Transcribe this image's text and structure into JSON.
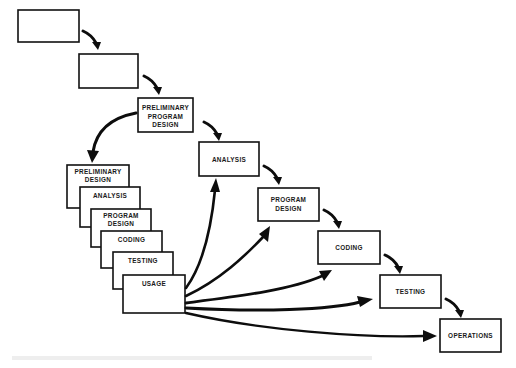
{
  "diagram": {
    "type": "waterfall-with-prototype-iteration",
    "main_flow": [
      {
        "id": "step-1",
        "label": ""
      },
      {
        "id": "step-2",
        "label": ""
      },
      {
        "id": "preliminary-program-design",
        "label_lines": [
          "PRELIMINARY",
          "PROGRAM",
          "DESIGN"
        ]
      },
      {
        "id": "analysis",
        "label_lines": [
          "ANALYSIS"
        ]
      },
      {
        "id": "program-design",
        "label_lines": [
          "PROGRAM",
          "DESIGN"
        ]
      },
      {
        "id": "coding",
        "label_lines": [
          "CODING"
        ]
      },
      {
        "id": "testing",
        "label_lines": [
          "TESTING"
        ]
      },
      {
        "id": "operations",
        "label_lines": [
          "OPERATIONS"
        ]
      }
    ],
    "prototype_stack": [
      {
        "id": "proto-preliminary-design",
        "label_lines": [
          "PRELIMINARY",
          "DESIGN"
        ]
      },
      {
        "id": "proto-analysis",
        "label_lines": [
          "ANALYSIS"
        ]
      },
      {
        "id": "proto-program-design",
        "label_lines": [
          "PROGRAM",
          "DESIGN"
        ]
      },
      {
        "id": "proto-coding",
        "label_lines": [
          "CODING"
        ]
      },
      {
        "id": "proto-testing",
        "label_lines": [
          "TESTING"
        ]
      },
      {
        "id": "proto-usage",
        "label_lines": [
          "USAGE"
        ]
      }
    ],
    "edges": [
      {
        "from": "step-1",
        "to": "step-2"
      },
      {
        "from": "step-2",
        "to": "preliminary-program-design"
      },
      {
        "from": "preliminary-program-design",
        "to": "analysis"
      },
      {
        "from": "analysis",
        "to": "program-design"
      },
      {
        "from": "program-design",
        "to": "coding"
      },
      {
        "from": "coding",
        "to": "testing"
      },
      {
        "from": "testing",
        "to": "operations"
      },
      {
        "from": "preliminary-program-design",
        "to": "proto-preliminary-design"
      },
      {
        "from": "proto-usage",
        "to": "analysis"
      },
      {
        "from": "proto-usage",
        "to": "program-design"
      },
      {
        "from": "proto-usage",
        "to": "coding"
      },
      {
        "from": "proto-usage",
        "to": "testing"
      },
      {
        "from": "proto-usage",
        "to": "operations"
      }
    ],
    "colors": {
      "stroke": "#111111",
      "background": "#ffffff",
      "text": "#1a1a1a"
    }
  },
  "labels": {
    "ppd_1": "PRELIMINARY",
    "ppd_2": "PROGRAM",
    "ppd_3": "DESIGN",
    "analysis": "ANALYSIS",
    "pd_1": "PROGRAM",
    "pd_2": "DESIGN",
    "coding": "CODING",
    "testing": "TESTING",
    "operations": "OPERATIONS",
    "s_pd_1": "PRELIMINARY",
    "s_pd_2": "DESIGN",
    "s_analysis": "ANALYSIS",
    "s_prog_1": "PROGRAM",
    "s_prog_2": "DESIGN",
    "s_coding": "CODING",
    "s_testing": "TESTING",
    "s_usage": "USAGE"
  }
}
